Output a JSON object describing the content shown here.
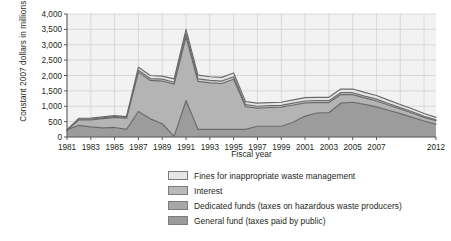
{
  "chart_data": {
    "type": "area",
    "stacked": true,
    "title": "",
    "xlabel": "Fiscal year",
    "ylabel": "Constant 2007 dollars in millions",
    "ylim": [
      0,
      4000
    ],
    "ytick_labels": [
      "0",
      "500",
      "1,000",
      "1,500",
      "2,000",
      "2,500",
      "3,000",
      "3,500",
      "4,000"
    ],
    "ytick_values": [
      0,
      500,
      1000,
      1500,
      2000,
      2500,
      3000,
      3500,
      4000
    ],
    "grid": true,
    "legend_position": "bottom",
    "x": [
      1981,
      1982,
      1983,
      1984,
      1985,
      1986,
      1987,
      1988,
      1989,
      1990,
      1991,
      1992,
      1993,
      1994,
      1995,
      1996,
      1997,
      1998,
      1999,
      2000,
      2001,
      2002,
      2003,
      2004,
      2005,
      2006,
      2007,
      2008,
      2009,
      2010,
      2011,
      2012
    ],
    "xtick_labels": [
      "1981",
      "1983",
      "1985",
      "1987",
      "1989",
      "1991",
      "1993",
      "1995",
      "1997",
      "1999",
      "2001",
      "2003",
      "2005",
      "2007",
      "2012"
    ],
    "xtick_values": [
      1981,
      1983,
      1985,
      1987,
      1989,
      1991,
      1993,
      1995,
      1997,
      1999,
      2001,
      2003,
      2005,
      2007,
      2012
    ],
    "series": [
      {
        "name": "General fund (taxes paid by public)",
        "color": "#9c9c9c",
        "values": [
          230,
          380,
          330,
          300,
          310,
          250,
          830,
          590,
          430,
          20,
          1180,
          250,
          250,
          250,
          250,
          250,
          350,
          350,
          350,
          480,
          680,
          780,
          790,
          1100,
          1130,
          1060,
          980,
          870,
          760,
          640,
          520,
          420
        ]
      },
      {
        "name": "Dedicated funds (taxes on hazardous waste producers)",
        "color": "#b4b4b4",
        "values": [
          0,
          180,
          230,
          300,
          330,
          360,
          1280,
          1250,
          1390,
          1700,
          2080,
          1560,
          1510,
          1490,
          1630,
          740,
          590,
          610,
          620,
          560,
          430,
          340,
          330,
          280,
          250,
          210,
          190,
          170,
          150,
          140,
          120,
          110
        ]
      },
      {
        "name": "Interest",
        "color": "#cfcfcf",
        "values": [
          0,
          20,
          25,
          25,
          25,
          25,
          60,
          60,
          60,
          60,
          100,
          80,
          80,
          80,
          80,
          60,
          60,
          60,
          60,
          60,
          60,
          60,
          60,
          60,
          60,
          60,
          60,
          50,
          45,
          40,
          35,
          30
        ]
      },
      {
        "name": "Fines for inappropriate waste management",
        "color": "#e6e6e6",
        "values": [
          0,
          30,
          30,
          30,
          30,
          30,
          100,
          100,
          100,
          110,
          130,
          120,
          120,
          120,
          120,
          100,
          100,
          100,
          100,
          110,
          110,
          110,
          110,
          120,
          120,
          120,
          120,
          110,
          100,
          100,
          90,
          80
        ]
      }
    ],
    "legend_entries": [
      {
        "label": "Fines for inappropriate waste management",
        "color": "#e6e6e6"
      },
      {
        "label": "Interest",
        "color": "#b9b9b9"
      },
      {
        "label": "Dedicated funds (taxes on hazardous waste producers)",
        "color": "#a8a8a8"
      },
      {
        "label": "General fund (taxes paid by public)",
        "color": "#9a9a9a"
      }
    ]
  }
}
